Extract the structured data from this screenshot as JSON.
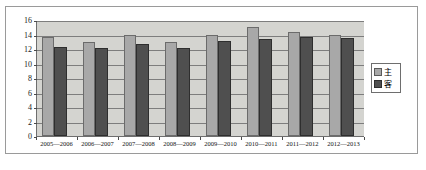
{
  "chart_data": {
    "type": "bar",
    "title": "",
    "xlabel": "",
    "ylabel": "",
    "ylim": [
      0,
      16
    ],
    "yticks": [
      0,
      2,
      4,
      6,
      8,
      10,
      12,
      14,
      16
    ],
    "ytick_labels": [
      "0",
      "2",
      "4",
      "6",
      "8",
      "10",
      "12",
      "14",
      "16"
    ],
    "grid": true,
    "legend_position": "right",
    "categories": [
      "2005—2006",
      "2006—2007",
      "2007—2008",
      "2008—2009",
      "2009—2010",
      "2010—2011",
      "2011—2012",
      "2012—2013"
    ],
    "series": [
      {
        "name": "主",
        "color": "#a8a8a8",
        "values": [
          13.6,
          12.9,
          14.0,
          12.9,
          14.0,
          15.1,
          14.3,
          14.0
        ]
      },
      {
        "name": "客",
        "color": "#4f4f4f",
        "values": [
          12.3,
          12.2,
          12.7,
          12.1,
          13.1,
          13.4,
          13.6,
          13.5
        ]
      }
    ]
  },
  "legend": {
    "entries": [
      {
        "label": "主"
      },
      {
        "label": "客"
      }
    ]
  },
  "colors": {
    "plot_background": "#d4d4d0",
    "gridline": "#7d7d7d",
    "axis": "#6e6e6e",
    "frame": "#9a9a9a",
    "host_bar": "#a8a8a8",
    "guest_bar": "#4f4f4f"
  }
}
